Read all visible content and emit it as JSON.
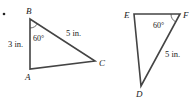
{
  "figure": {
    "bullet": "•",
    "triangle_abc": {
      "vertices": {
        "A": "A",
        "B": "B",
        "C": "C"
      },
      "side_ab": "3 in.",
      "side_bc": "5 in.",
      "angle_b": "60°"
    },
    "triangle_def": {
      "vertices": {
        "D": "D",
        "E": "E",
        "F": "F"
      },
      "side_fd": "5 in.",
      "angle_f": "60°"
    },
    "colors": {
      "stroke": "#444444",
      "text": "#222222"
    }
  }
}
